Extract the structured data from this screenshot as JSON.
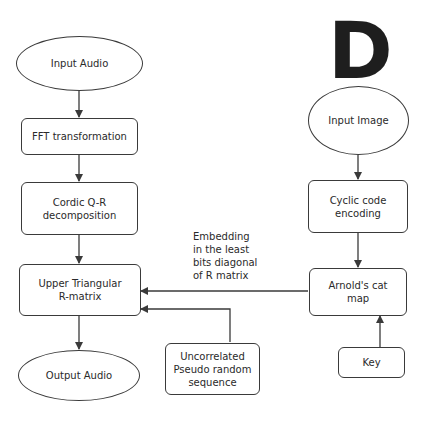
{
  "diagram": {
    "type": "flowchart",
    "left_flow": {
      "input_audio": "Input Audio",
      "fft": "FFT transformation",
      "cordic_line1": "Cordic Q-R",
      "cordic_line2": "decomposition",
      "upper_line1": "Upper Triangular",
      "upper_line2": "R-matrix",
      "output_audio": "Output Audio"
    },
    "right_flow": {
      "watermark_glyph": "D",
      "input_image": "Input Image",
      "cyclic_line1": "Cyclic code",
      "cyclic_line2": "encoding",
      "arnold_line1": "Arnold's cat",
      "arnold_line2": "map",
      "key": "Key"
    },
    "middle": {
      "prng_line1": "Uncorrelated",
      "prng_line2": "Pseudo random",
      "prng_line3": "sequence",
      "embed_line1": "Embedding",
      "embed_line2": "in the least",
      "embed_line3": "bits diagonal",
      "embed_line4": "of R matrix"
    },
    "edges": [
      {
        "from": "Input Audio",
        "to": "FFT transformation"
      },
      {
        "from": "FFT transformation",
        "to": "Cordic Q-R decomposition"
      },
      {
        "from": "Cordic Q-R decomposition",
        "to": "Upper Triangular R-matrix"
      },
      {
        "from": "Upper Triangular R-matrix",
        "to": "Output Audio"
      },
      {
        "from": "Input Image",
        "to": "Cyclic code encoding"
      },
      {
        "from": "Cyclic code encoding",
        "to": "Arnold's cat map"
      },
      {
        "from": "Key",
        "to": "Arnold's cat map"
      },
      {
        "from": "Arnold's cat map",
        "to": "Upper Triangular R-matrix",
        "label": "Embedding in the least bits diagonal of R matrix"
      },
      {
        "from": "Uncorrelated Pseudo random sequence",
        "to": "Upper Triangular R-matrix"
      }
    ],
    "colors": {
      "stroke": "#3a3a3a",
      "text": "#2a2a2a",
      "background": "#ffffff"
    }
  }
}
